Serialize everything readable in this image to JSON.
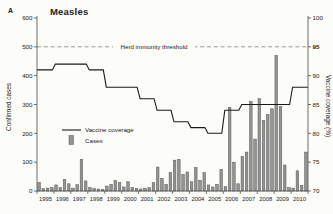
{
  "panel_label": "A",
  "title": "Measles",
  "threshold_label": "Herd immunity threshold",
  "legend": {
    "line_label": "Vaccine coverage",
    "bar_label": "Cases"
  },
  "colors": {
    "background": "#fcfcf8",
    "text": "#222222",
    "axis": "#4a4a4a",
    "bar_fill": "#949494",
    "bar_stroke": "#565656",
    "line": "#1a1a1a",
    "threshold": "#808080"
  },
  "chart_data": {
    "type": "combo",
    "title": "Measles",
    "years": [
      "1995",
      "1996",
      "1997",
      "1998",
      "1999",
      "2000",
      "2001",
      "2002",
      "2003",
      "2004",
      "2005",
      "2006",
      "2007",
      "2008",
      "2009",
      "2010"
    ],
    "left_axis": {
      "label": "Confirmed cases",
      "min": 0,
      "max": 600,
      "tick_step": 100
    },
    "right_axis": {
      "label": "Vaccine coverage (%)",
      "min": 70,
      "max": 100,
      "tick_step": 5,
      "bold_tick": 95
    },
    "threshold": {
      "label": "Herd immunity threshold",
      "coverage_value": 95,
      "cases_value": 500
    },
    "legend_position": "middle-left",
    "grid": false,
    "series": [
      {
        "name": "Cases",
        "type": "bar",
        "axis": "left",
        "frequency": "quarterly",
        "values": [
          30,
          8,
          10,
          12,
          21,
          12,
          40,
          25,
          10,
          22,
          110,
          35,
          12,
          9,
          7,
          6,
          17,
          23,
          37,
          29,
          14,
          32,
          12,
          9,
          7,
          9,
          12,
          29,
          83,
          44,
          23,
          64,
          107,
          110,
          58,
          66,
          32,
          81,
          37,
          64,
          21,
          14,
          23,
          75,
          15,
          290,
          100,
          25,
          120,
          135,
          310,
          180,
          320,
          245,
          265,
          285,
          470,
          293,
          90,
          12,
          10,
          70,
          20,
          135
        ]
      },
      {
        "name": "Vaccine coverage",
        "type": "step-line",
        "axis": "right",
        "frequency": "yearly",
        "values": [
          91,
          92,
          92,
          91,
          88,
          88,
          86,
          84,
          82,
          81,
          80,
          84,
          85,
          85,
          85,
          88
        ]
      }
    ]
  }
}
